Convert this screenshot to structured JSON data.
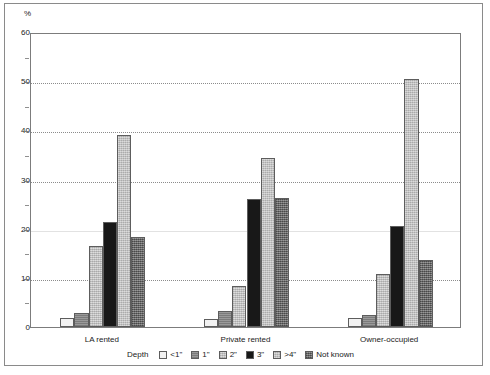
{
  "chart_data": {
    "type": "bar",
    "title": "",
    "subtitle": "",
    "xlabel": "",
    "ylabel": "%",
    "ylim": [
      0,
      60
    ],
    "yticks": [
      0,
      10,
      20,
      30,
      40,
      50,
      60
    ],
    "ytick_labels": [
      "0",
      "10",
      "20",
      "30",
      "40",
      "50",
      "60"
    ],
    "yminor_ticks": [
      5,
      15,
      25,
      35,
      45,
      55
    ],
    "grid": "horizontal-dotted",
    "legend_position": "bottom",
    "legend_title": "Depth",
    "categories": [
      "LA rented",
      "Private rented",
      "Owner-occupied"
    ],
    "series": [
      {
        "name": "<1\"",
        "values": [
          1.8,
          1.7,
          1.8
        ],
        "color": "#f2f2f2"
      },
      {
        "name": "1\"",
        "values": [
          2.9,
          3.3,
          2.5
        ],
        "color": "#8f8f8f"
      },
      {
        "name": "2\"",
        "values": [
          16.5,
          8.3,
          10.7
        ],
        "color": "#cbcbcb"
      },
      {
        "name": "3\"",
        "values": [
          21.4,
          26.0,
          20.5
        ],
        "color": "#181818"
      },
      {
        "name": ">4\"",
        "values": [
          39.1,
          34.4,
          50.5
        ],
        "color": "#bdbdbd"
      },
      {
        "name": "Not known",
        "values": [
          18.3,
          26.3,
          13.6
        ],
        "color": "#707070"
      }
    ]
  },
  "axis": {
    "y_unit": "%"
  },
  "legend": {
    "title": "Depth",
    "items": [
      {
        "label": "<1\""
      },
      {
        "label": "1\""
      },
      {
        "label": "2\""
      },
      {
        "label": "3\""
      },
      {
        "label": ">4\""
      },
      {
        "label": "Not known"
      }
    ]
  }
}
